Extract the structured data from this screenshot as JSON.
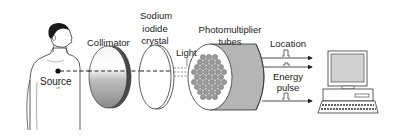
{
  "diagram": {
    "labels": {
      "source": "Source",
      "collimator": "Collimator",
      "crystal_line1": "Sodium",
      "crystal_line2": "iodide",
      "crystal_line3": "crystal",
      "light": "Light",
      "pmt_line1": "Photomultiplier",
      "pmt_line2": "tubes",
      "location": "Location",
      "energy_line1": "Energy",
      "energy_line2": "pulse"
    },
    "components": [
      "patient",
      "source",
      "collimator",
      "sodium-iodide-crystal",
      "photomultiplier-tubes",
      "computer"
    ],
    "signals": [
      "location",
      "location",
      "energy-pulse"
    ],
    "colors": {
      "line": "#222222",
      "pmt_fill": "#9a9a9a",
      "cylinder_side": "#b5b5b5",
      "skin": "#ffffff",
      "hair": "#1a1a1a"
    }
  }
}
